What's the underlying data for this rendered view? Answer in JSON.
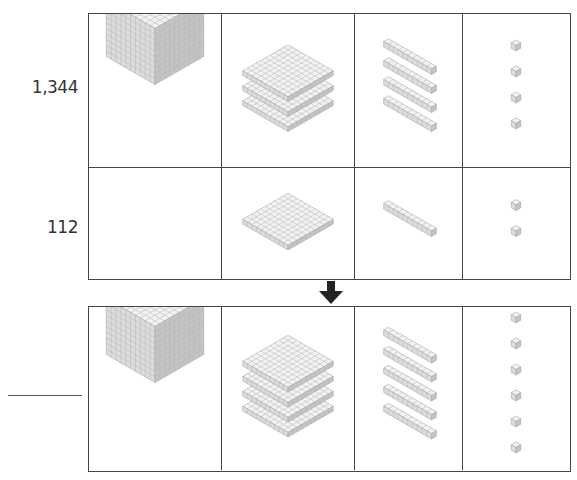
{
  "problem": {
    "addend_1": {
      "label": "1,344",
      "thousands": 1,
      "hundreds": 3,
      "tens": 4,
      "ones": 4
    },
    "addend_2": {
      "label": "112",
      "thousands": 0,
      "hundreds": 1,
      "tens": 1,
      "ones": 2
    },
    "result": {
      "label": "",
      "thousands": 1,
      "hundreds": 4,
      "tens": 5,
      "ones": 6
    }
  },
  "columns": [
    "thousands-cube",
    "hundreds-flat",
    "tens-rod",
    "ones-unit"
  ],
  "icons": {
    "arrow": "down-arrow-icon"
  },
  "colors": {
    "border": "#444444",
    "block_light": "#f2f2f2",
    "block_mid": "#dcdcdc",
    "block_dark": "#c4c4c4",
    "grid_line": "#b5b5b5",
    "arrow": "#222222"
  }
}
